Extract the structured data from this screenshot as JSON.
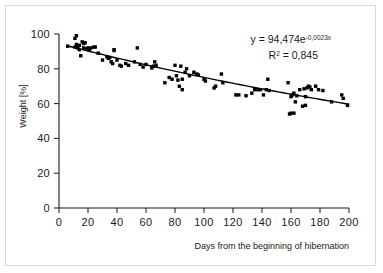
{
  "chart_data": {
    "type": "scatter",
    "title": "",
    "xlabel": "Days from the beginning of hibernation",
    "ylabel": "Weight [%]",
    "xlim": [
      0,
      200
    ],
    "ylim": [
      0,
      100
    ],
    "xticks": [
      0,
      20,
      40,
      60,
      80,
      100,
      120,
      140,
      160,
      180,
      200
    ],
    "yticks": [
      0,
      20,
      40,
      60,
      80,
      100
    ],
    "grid": false,
    "legend": null,
    "marker": "square",
    "marker_color": "#000000",
    "annotations": [
      {
        "name": "regression-equation",
        "text": "y = 94,474e",
        "superscript": "-0,0023x"
      },
      {
        "name": "r-squared",
        "text": "R",
        "superscript": "2",
        "value": " = 0,845"
      }
    ],
    "trendline": {
      "type": "exponential",
      "equation": "y = 94,474e^(-0,0023x)",
      "r_squared": 0.845,
      "a": 94.474,
      "b": -0.0023,
      "x_start": 5,
      "x_end": 200
    },
    "points": [
      [
        6,
        93
      ],
      [
        11,
        97.5
      ],
      [
        11,
        92.5
      ],
      [
        12,
        99
      ],
      [
        12,
        94
      ],
      [
        13,
        92
      ],
      [
        14,
        93.5
      ],
      [
        14,
        91
      ],
      [
        15,
        87.5
      ],
      [
        16,
        95.5
      ],
      [
        17,
        94.5
      ],
      [
        17,
        92
      ],
      [
        18,
        95
      ],
      [
        19,
        91.5
      ],
      [
        20,
        92
      ],
      [
        21,
        91
      ],
      [
        22,
        92
      ],
      [
        24,
        92.5
      ],
      [
        25,
        92.5
      ],
      [
        27,
        89
      ],
      [
        30,
        85
      ],
      [
        33,
        87
      ],
      [
        34,
        86
      ],
      [
        35,
        86.5
      ],
      [
        36,
        84
      ],
      [
        37,
        83
      ],
      [
        38,
        91
      ],
      [
        38,
        90.5
      ],
      [
        40,
        85
      ],
      [
        42,
        82
      ],
      [
        43,
        81.5
      ],
      [
        46,
        83
      ],
      [
        48,
        82
      ],
      [
        52,
        84
      ],
      [
        54,
        92
      ],
      [
        56,
        82.5
      ],
      [
        58,
        81
      ],
      [
        60,
        82.5
      ],
      [
        64,
        80.5
      ],
      [
        65,
        81.5
      ],
      [
        66,
        84
      ],
      [
        67,
        82
      ],
      [
        73,
        72
      ],
      [
        76,
        75
      ],
      [
        78,
        74
      ],
      [
        80,
        82
      ],
      [
        81,
        76
      ],
      [
        82,
        73.5
      ],
      [
        83,
        70
      ],
      [
        84,
        81.5
      ],
      [
        85,
        68
      ],
      [
        85,
        74
      ],
      [
        87,
        78
      ],
      [
        88,
        80
      ],
      [
        90,
        76
      ],
      [
        93,
        78
      ],
      [
        95,
        77
      ],
      [
        96,
        76.5
      ],
      [
        100,
        74
      ],
      [
        101,
        73
      ],
      [
        107,
        69
      ],
      [
        108,
        70
      ],
      [
        112,
        77
      ],
      [
        113,
        72
      ],
      [
        122,
        65
      ],
      [
        124,
        65
      ],
      [
        129,
        64.5
      ],
      [
        133,
        66
      ],
      [
        135,
        68
      ],
      [
        137,
        68
      ],
      [
        139,
        68
      ],
      [
        141,
        65
      ],
      [
        143,
        68
      ],
      [
        144,
        74
      ],
      [
        145,
        67.5
      ],
      [
        158,
        72
      ],
      [
        159,
        54
      ],
      [
        160,
        54.5
      ],
      [
        160,
        64
      ],
      [
        161,
        65
      ],
      [
        162,
        66
      ],
      [
        162,
        54.5
      ],
      [
        163,
        61
      ],
      [
        164,
        64.5
      ],
      [
        166,
        68
      ],
      [
        168,
        58.5
      ],
      [
        169,
        68.5
      ],
      [
        170,
        64
      ],
      [
        170,
        59
      ],
      [
        171,
        69
      ],
      [
        172,
        70
      ],
      [
        173,
        69.5
      ],
      [
        174,
        68
      ],
      [
        177,
        70
      ],
      [
        179,
        68
      ],
      [
        182,
        67.5
      ],
      [
        188,
        61
      ],
      [
        195,
        65
      ],
      [
        196,
        63
      ],
      [
        199,
        59
      ]
    ]
  },
  "axes": {
    "y_tick_labels": [
      "100",
      "80",
      "60",
      "40",
      "20",
      "0"
    ],
    "x_tick_labels": [
      "0",
      "20",
      "40",
      "60",
      "80",
      "100",
      "120",
      "140",
      "160",
      "180",
      "200"
    ]
  }
}
